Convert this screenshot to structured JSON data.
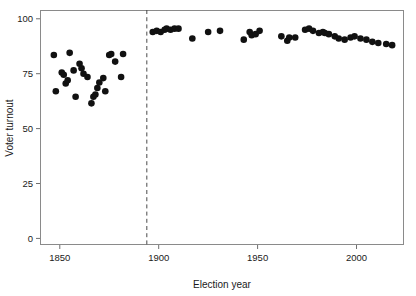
{
  "chart_data": {
    "type": "scatter",
    "title": "",
    "xlabel": "Election year",
    "ylabel": "Voter turnout",
    "xlim": [
      1840,
      2024
    ],
    "ylim": [
      -3,
      104
    ],
    "xticks": [
      1850,
      1900,
      1950,
      2000
    ],
    "xtick_labels": [
      "1850",
      "1900",
      "1950",
      "2000"
    ],
    "yticks": [
      0,
      25,
      50,
      75,
      100
    ],
    "ytick_labels": [
      "0",
      "25",
      "50",
      "75",
      "100"
    ],
    "grid": false,
    "legend": null,
    "marker": "filled-circle",
    "marker_color": "#111111",
    "marker_size": 3.3,
    "annotations": [
      {
        "type": "vertical-dashed-line",
        "x": 1894,
        "label": "",
        "color": "#4a4a4a"
      }
    ],
    "series": [
      {
        "name": "Voter turnout by election",
        "points": [
          {
            "x": 1847,
            "y": 83.5
          },
          {
            "x": 1848,
            "y": 67.0
          },
          {
            "x": 1851,
            "y": 75.5
          },
          {
            "x": 1852,
            "y": 74.5
          },
          {
            "x": 1853,
            "y": 70.5
          },
          {
            "x": 1854,
            "y": 72.0
          },
          {
            "x": 1855,
            "y": 84.5
          },
          {
            "x": 1857,
            "y": 76.5
          },
          {
            "x": 1858,
            "y": 64.5
          },
          {
            "x": 1860,
            "y": 79.5
          },
          {
            "x": 1861,
            "y": 77.5
          },
          {
            "x": 1862,
            "y": 75.0
          },
          {
            "x": 1864,
            "y": 73.5
          },
          {
            "x": 1866,
            "y": 61.5
          },
          {
            "x": 1867,
            "y": 64.5
          },
          {
            "x": 1868,
            "y": 65.5
          },
          {
            "x": 1869,
            "y": 68.5
          },
          {
            "x": 1870,
            "y": 71.0
          },
          {
            "x": 1872,
            "y": 73.0
          },
          {
            "x": 1873,
            "y": 67.0
          },
          {
            "x": 1875,
            "y": 83.5
          },
          {
            "x": 1876,
            "y": 84.0
          },
          {
            "x": 1878,
            "y": 80.5
          },
          {
            "x": 1881,
            "y": 73.5
          },
          {
            "x": 1882,
            "y": 84.0
          },
          {
            "x": 1897,
            "y": 94.0
          },
          {
            "x": 1899,
            "y": 94.5
          },
          {
            "x": 1901,
            "y": 94.0
          },
          {
            "x": 1903,
            "y": 95.0
          },
          {
            "x": 1904,
            "y": 95.5
          },
          {
            "x": 1906,
            "y": 95.0
          },
          {
            "x": 1908,
            "y": 95.5
          },
          {
            "x": 1910,
            "y": 95.5
          },
          {
            "x": 1917,
            "y": 91.0
          },
          {
            "x": 1925,
            "y": 94.0
          },
          {
            "x": 1931,
            "y": 94.5
          },
          {
            "x": 1943,
            "y": 90.5
          },
          {
            "x": 1946,
            "y": 94.0
          },
          {
            "x": 1947,
            "y": 92.5
          },
          {
            "x": 1949,
            "y": 93.0
          },
          {
            "x": 1951,
            "y": 94.5
          },
          {
            "x": 1962,
            "y": 92.0
          },
          {
            "x": 1965,
            "y": 90.0
          },
          {
            "x": 1966,
            "y": 91.5
          },
          {
            "x": 1969,
            "y": 91.5
          },
          {
            "x": 1974,
            "y": 95.0
          },
          {
            "x": 1976,
            "y": 95.5
          },
          {
            "x": 1978,
            "y": 94.5
          },
          {
            "x": 1981,
            "y": 93.5
          },
          {
            "x": 1983,
            "y": 94.0
          },
          {
            "x": 1984,
            "y": 93.5
          },
          {
            "x": 1986,
            "y": 93.0
          },
          {
            "x": 1989,
            "y": 92.0
          },
          {
            "x": 1991,
            "y": 91.0
          },
          {
            "x": 1994,
            "y": 90.5
          },
          {
            "x": 1997,
            "y": 91.5
          },
          {
            "x": 1999,
            "y": 92.0
          },
          {
            "x": 2002,
            "y": 91.0
          },
          {
            "x": 2005,
            "y": 90.5
          },
          {
            "x": 2008,
            "y": 89.5
          },
          {
            "x": 2011,
            "y": 89.0
          },
          {
            "x": 2015,
            "y": 88.5
          },
          {
            "x": 2018,
            "y": 88.0
          }
        ]
      }
    ]
  },
  "geometry": {
    "plot_left": 40,
    "plot_right": 404,
    "plot_top": 10,
    "plot_bottom": 245
  }
}
